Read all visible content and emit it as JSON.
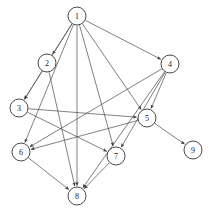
{
  "diagram": {
    "type": "directed-graph",
    "background_color": "#ffffff",
    "node_fill_color": "#ffffff",
    "node_stroke_color": "#333333",
    "edge_color": "#4a4a4a",
    "label_color": "#222222",
    "node_radius": 9,
    "nodes": [
      {
        "id": "1",
        "label": "1",
        "x": 77,
        "y": 16
      },
      {
        "id": "2",
        "label": "2",
        "x": 47,
        "y": 63
      },
      {
        "id": "3",
        "label": "3",
        "x": 19,
        "y": 108
      },
      {
        "id": "4",
        "label": "4",
        "x": 170,
        "y": 64
      },
      {
        "id": "5",
        "label": "5",
        "x": 147,
        "y": 118
      },
      {
        "id": "6",
        "label": "6",
        "x": 21,
        "y": 152
      },
      {
        "id": "7",
        "label": "7",
        "x": 116,
        "y": 156
      },
      {
        "id": "8",
        "label": "8",
        "x": 77,
        "y": 196
      },
      {
        "id": "9",
        "label": "9",
        "x": 193,
        "y": 150
      }
    ],
    "edges": [
      {
        "from": "1",
        "to": "2"
      },
      {
        "from": "1",
        "to": "3"
      },
      {
        "from": "1",
        "to": "4"
      },
      {
        "from": "1",
        "to": "5"
      },
      {
        "from": "1",
        "to": "6"
      },
      {
        "from": "1",
        "to": "7"
      },
      {
        "from": "1",
        "to": "8"
      },
      {
        "from": "2",
        "to": "3"
      },
      {
        "from": "2",
        "to": "8"
      },
      {
        "from": "3",
        "to": "7"
      },
      {
        "from": "3",
        "to": "5"
      },
      {
        "from": "4",
        "to": "5"
      },
      {
        "from": "4",
        "to": "6"
      },
      {
        "from": "4",
        "to": "7"
      },
      {
        "from": "4",
        "to": "8"
      },
      {
        "from": "5",
        "to": "6"
      },
      {
        "from": "5",
        "to": "9"
      },
      {
        "from": "6",
        "to": "8"
      },
      {
        "from": "7",
        "to": "8"
      }
    ]
  }
}
